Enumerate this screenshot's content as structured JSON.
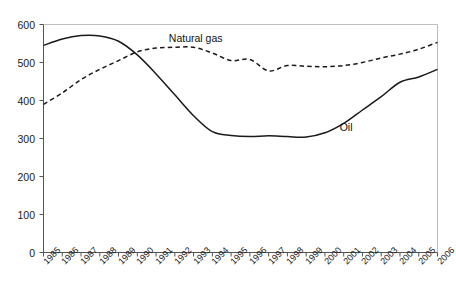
{
  "chart_data": {
    "type": "line",
    "title": "",
    "subtitle": "",
    "xlabel": "",
    "ylabel": "",
    "x": [
      "1985",
      "1986",
      "1987",
      "1988",
      "1989",
      "1990",
      "1991",
      "1992",
      "1993",
      "1994",
      "1995",
      "1996",
      "1997",
      "1998",
      "1999",
      "2000",
      "2001",
      "2002",
      "2003",
      "2004",
      "2005",
      "2006"
    ],
    "categories": [
      "1985",
      "1986",
      "1987",
      "1988",
      "1989",
      "1990",
      "1991",
      "1992",
      "1993",
      "1994",
      "1995",
      "1996",
      "1997",
      "1998",
      "1999",
      "2000",
      "2001",
      "2002",
      "2003",
      "2004",
      "2005",
      "2006"
    ],
    "series": [
      {
        "name": "Oil",
        "style": "solid",
        "color": "#1a1a1a",
        "values": [
          545,
          562,
          571,
          570,
          556,
          520,
          470,
          415,
          360,
          318,
          308,
          305,
          307,
          305,
          304,
          315,
          340,
          375,
          410,
          448,
          462,
          482
        ]
      },
      {
        "name": "Natural gas",
        "style": "dashed",
        "color": "#1a1a1a",
        "values": [
          390,
          420,
          455,
          482,
          505,
          528,
          538,
          540,
          540,
          525,
          505,
          508,
          478,
          492,
          490,
          489,
          492,
          500,
          512,
          522,
          535,
          553
        ]
      }
    ],
    "ylim": [
      0,
      600
    ],
    "yticks": [
      0,
      100,
      200,
      300,
      400,
      500,
      600
    ],
    "ytick_labels": [
      "0",
      "100",
      "200",
      "300",
      "400",
      "500",
      "600"
    ],
    "grid": false,
    "legend": "inline-annotations",
    "annotations": [
      {
        "text": "Natural gas",
        "x": "1992",
        "y": 560
      },
      {
        "text": "Oil",
        "x": "2001",
        "y": 330
      }
    ]
  },
  "axes": {
    "y_axis_name": "value-axis",
    "x_axis_name": "year-axis"
  }
}
